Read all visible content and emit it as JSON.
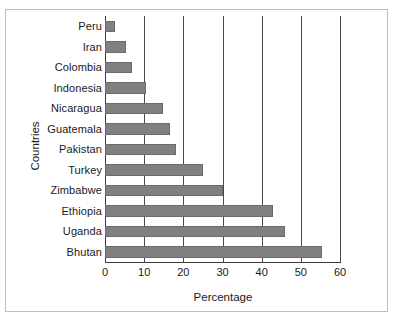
{
  "chart_data": {
    "type": "bar",
    "orientation": "horizontal",
    "title": "",
    "xlabel": "Percentage",
    "ylabel": "Countries",
    "categories": [
      "Peru",
      "Iran",
      "Colombia",
      "Indonesia",
      "Nicaragua",
      "Guatemala",
      "Pakistan",
      "Turkey",
      "Zimbabwe",
      "Ethiopia",
      "Uganda",
      "Bhutan"
    ],
    "values": [
      2.6,
      5.4,
      7.0,
      10.5,
      14.8,
      16.7,
      18.2,
      25.0,
      30.0,
      43.0,
      46.0,
      55.4
    ],
    "xlim": [
      0,
      60
    ],
    "xticks": [
      0,
      10,
      20,
      30,
      40,
      50,
      60
    ],
    "xticklabels": [
      "0",
      "10",
      "20",
      "30",
      "40",
      "50",
      "60"
    ],
    "grid": "vertical",
    "legend": null,
    "bar_color": "#808080",
    "bar_edge_color": "#6a6a6a",
    "axis_color": "#3a3a3a",
    "frame_color": "#bdbdbd",
    "background": "#ffffff"
  }
}
